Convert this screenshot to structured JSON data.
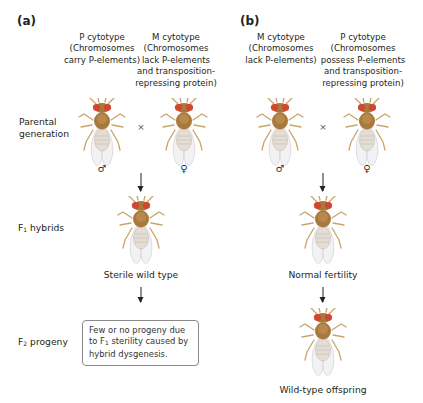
{
  "panels": [
    {
      "label": "(a)",
      "columns": [
        {
          "title": "P cytotype",
          "lines": [
            "(Chromosomes",
            "carry P-elements)"
          ]
        },
        {
          "title": "M cytotype",
          "lines": [
            "(Chromosomes",
            "lack P-elements",
            "and transposition-",
            "repressing protein)"
          ]
        }
      ],
      "parents": {
        "left_sex": "♂",
        "right_sex": "♀",
        "cross_symbol": "×"
      },
      "f1_caption": "Sterile wild type",
      "f2_note": "Few or no progeny due to F₁ sterility caused by hybrid dysgenesis."
    },
    {
      "label": "(b)",
      "columns": [
        {
          "title": "M cytotype",
          "lines": [
            "(Chromosomes",
            "lack P-elements)"
          ]
        },
        {
          "title": "P cytotype",
          "lines": [
            "(Chromosomes",
            "possess P-elements",
            "and transposition-",
            "repressing protein)"
          ]
        }
      ],
      "parents": {
        "left_sex": "♂",
        "right_sex": "♀",
        "cross_symbol": "×"
      },
      "f1_caption": "Normal fertility",
      "f2_caption": "Wild-type offspring"
    }
  ],
  "row_labels": {
    "parental": [
      "Parental",
      "generation"
    ],
    "f1": {
      "prefix": "F",
      "sub": "1",
      "text": " hybrids"
    },
    "f2": {
      "prefix": "F",
      "sub": "2",
      "text": " progeny"
    }
  },
  "f2_note_lines": {
    "line1": "Few or no progeny due",
    "line2_pre": "to F",
    "line2_sub": "1",
    "line2_post": " sterility caused by",
    "line3": "hybrid dysgenesis."
  },
  "colors": {
    "fly_thorax": "#a8793c",
    "fly_eye": "#d2452e",
    "fly_abdomen": "#e6e1da",
    "fly_wing": "#f1f1f3",
    "text": "#231f20",
    "box_border": "#8a8a8a"
  },
  "icons": {
    "fly": "drosophila-fly-icon",
    "male": "male-symbol-icon",
    "female": "female-symbol-icon",
    "arrow": "arrow-down-icon"
  }
}
